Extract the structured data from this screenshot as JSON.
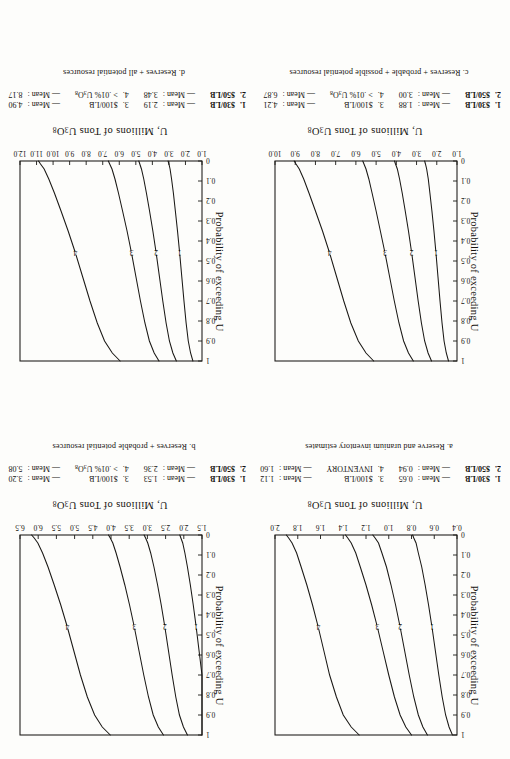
{
  "page": {
    "orientation_note": "upside-down-scan",
    "figure_count": 4
  },
  "common": {
    "ylabel": "Probability of exceeding U",
    "xlabel_prefix": "U, Millions of Tons U",
    "xlabel_sub1": "3",
    "xlabel_mid": "O",
    "xlabel_sub2": "8",
    "mean_word": "Mean :",
    "dash": "—",
    "curve_numbers": [
      "1",
      "2",
      "3",
      "4"
    ],
    "y_ticks": [
      "1",
      "0.9",
      "0.8",
      "0.7",
      "0.6",
      "0.5",
      "0.4",
      "0.3",
      "0.2",
      "0.1",
      "0"
    ],
    "y_values": [
      1,
      0.9,
      0.8,
      0.7,
      0.6,
      0.5,
      0.4,
      0.3,
      0.2,
      0.1,
      0
    ]
  },
  "figures": [
    {
      "id": "a",
      "caption": "a. Reserve and uranium inventory estimates",
      "x_ticks": [
        "0.4",
        "0.6",
        "0.8",
        "1.0",
        "1.2",
        "1.4",
        "1.6",
        "1.8",
        "2.0"
      ],
      "xlim": [
        0.4,
        2.0
      ],
      "legend": {
        "row1": {
          "key": "1.",
          "label": "$30/LB",
          "mean": "0.65",
          "key2": "3.",
          "label2": "$100/LB",
          "mean2": "1.12"
        },
        "row2": {
          "key": "2.",
          "label": "$50/LB",
          "mean": "0.94",
          "key2": "4.",
          "label2": "INVENTORY",
          "mean2": "1.60"
        }
      },
      "chart_data": {
        "type": "line",
        "title": "a. Reserve and uranium inventory estimates",
        "xlabel": "U, Millions of Tons U3O8",
        "ylabel": "Probability of exceeding U",
        "xlim": [
          0.4,
          2.0
        ],
        "ylim": [
          0,
          1
        ],
        "grid": false,
        "legend_position": "below-plot",
        "series": [
          {
            "name": "1. $30/LB",
            "mean": 0.65,
            "x": [
              0.44,
              0.47,
              0.5,
              0.53,
              0.56,
              0.59,
              0.62,
              0.65,
              0.68,
              0.71,
              0.74,
              0.76,
              0.78,
              0.79
            ],
            "y": [
              1.0,
              0.96,
              0.9,
              0.81,
              0.7,
              0.58,
              0.46,
              0.35,
              0.25,
              0.16,
              0.09,
              0.04,
              0.015,
              0.0
            ]
          },
          {
            "name": "2. $50/LB",
            "mean": 0.94,
            "x": [
              0.66,
              0.7,
              0.74,
              0.78,
              0.82,
              0.86,
              0.9,
              0.94,
              0.98,
              1.02,
              1.06,
              1.09,
              1.12,
              1.14
            ],
            "y": [
              1.0,
              0.96,
              0.9,
              0.81,
              0.7,
              0.58,
              0.46,
              0.35,
              0.25,
              0.16,
              0.09,
              0.04,
              0.015,
              0.0
            ]
          },
          {
            "name": "3. $100/LB",
            "mean": 1.12,
            "x": [
              0.8,
              0.85,
              0.9,
              0.95,
              1.0,
              1.05,
              1.1,
              1.15,
              1.2,
              1.25,
              1.29,
              1.33,
              1.36,
              1.38
            ],
            "y": [
              1.0,
              0.96,
              0.9,
              0.81,
              0.7,
              0.58,
              0.46,
              0.35,
              0.25,
              0.16,
              0.09,
              0.04,
              0.015,
              0.0
            ]
          },
          {
            "name": "4. INVENTORY",
            "mean": 1.6,
            "x": [
              1.26,
              1.33,
              1.4,
              1.46,
              1.52,
              1.57,
              1.62,
              1.67,
              1.72,
              1.77,
              1.81,
              1.85,
              1.88,
              1.9
            ],
            "y": [
              1.0,
              0.96,
              0.9,
              0.81,
              0.7,
              0.58,
              0.46,
              0.35,
              0.25,
              0.16,
              0.09,
              0.04,
              0.015,
              0.0
            ]
          }
        ]
      }
    },
    {
      "id": "b",
      "caption": "b. Reserves + probable potential resources",
      "x_ticks": [
        "1.5",
        "2.0",
        "2.5",
        "3.0",
        "3.5",
        "4.0",
        "4.5",
        "5.0",
        "5.5",
        "6.0",
        "6.5"
      ],
      "xlim": [
        1.5,
        6.5
      ],
      "legend": {
        "row1": {
          "key": "1.",
          "label": "$30/LB",
          "mean": "1.53",
          "key2": "3.",
          "label2": "$100/LB",
          "mean2": "3.20"
        },
        "row2": {
          "key": "2.",
          "label": "$50/LB",
          "mean": "2.36",
          "key2": "4.",
          "label2": "> .01% U3O8",
          "mean2": "5.08"
        }
      },
      "chart_data": {
        "type": "line",
        "title": "b. Reserves + probable potential resources",
        "xlabel": "U, Millions of Tons U3O8",
        "ylabel": "Probability of exceeding U",
        "xlim": [
          1.5,
          6.5
        ],
        "ylim": [
          0,
          1
        ],
        "grid": false,
        "legend_position": "below-plot",
        "series": [
          {
            "name": "1. $30/LB",
            "mean": 1.53,
            "x": [
              1.18,
              1.26,
              1.34,
              1.42,
              1.5,
              1.58,
              1.66,
              1.74,
              1.82,
              1.9,
              1.97,
              2.03,
              2.08,
              2.11
            ],
            "y": [
              1.0,
              0.96,
              0.9,
              0.81,
              0.7,
              0.58,
              0.46,
              0.35,
              0.25,
              0.16,
              0.09,
              0.04,
              0.015,
              0.0
            ]
          },
          {
            "name": "2. $50/LB",
            "mean": 2.36,
            "x": [
              1.9,
              2.01,
              2.12,
              2.22,
              2.32,
              2.42,
              2.52,
              2.62,
              2.72,
              2.82,
              2.91,
              2.99,
              3.05,
              3.09
            ],
            "y": [
              1.0,
              0.96,
              0.9,
              0.81,
              0.7,
              0.58,
              0.46,
              0.35,
              0.25,
              0.16,
              0.09,
              0.04,
              0.015,
              0.0
            ]
          },
          {
            "name": "3. $100/LB",
            "mean": 3.2,
            "x": [
              2.56,
              2.7,
              2.84,
              2.97,
              3.1,
              3.23,
              3.36,
              3.49,
              3.62,
              3.75,
              3.86,
              3.95,
              4.02,
              4.07
            ],
            "y": [
              1.0,
              0.96,
              0.9,
              0.81,
              0.7,
              0.58,
              0.46,
              0.35,
              0.25,
              0.16,
              0.09,
              0.04,
              0.015,
              0.0
            ]
          },
          {
            "name": "4. > .01% U3O8",
            "mean": 5.08,
            "x": [
              4.02,
              4.24,
              4.45,
              4.65,
              4.84,
              5.02,
              5.2,
              5.38,
              5.56,
              5.73,
              5.88,
              6.01,
              6.11,
              6.18
            ],
            "y": [
              1.0,
              0.96,
              0.9,
              0.81,
              0.7,
              0.58,
              0.46,
              0.35,
              0.25,
              0.16,
              0.09,
              0.04,
              0.015,
              0.0
            ]
          }
        ]
      }
    },
    {
      "id": "c",
      "caption": "c. Reserves + probable + possible potential resources",
      "x_ticks": [
        "1.0",
        "2.0",
        "3.0",
        "4.0",
        "5.0",
        "6.0",
        "7.0",
        "8.0",
        "9.0",
        "10.0"
      ],
      "xlim": [
        1.0,
        10.0
      ],
      "legend": {
        "row1": {
          "key": "1.",
          "label": "$30/LB",
          "mean": "1.88",
          "key2": "3.",
          "label2": "$100/LB",
          "mean2": "4.21"
        },
        "row2": {
          "key": "2.",
          "label": "$50/LB",
          "mean": "3.00",
          "key2": "4.",
          "label2": "> .01% U3O8",
          "mean2": "6.87"
        }
      },
      "chart_data": {
        "type": "line",
        "title": "c. Reserves + probable + possible potential resources",
        "xlabel": "U, Millions of Tons U3O8",
        "ylabel": "Probability of exceeding U",
        "xlim": [
          1.0,
          10.0
        ],
        "ylim": [
          0,
          1
        ],
        "grid": false,
        "legend_position": "below-plot",
        "series": [
          {
            "name": "1. $30/LB",
            "mean": 1.88,
            "x": [
              1.42,
              1.53,
              1.64,
              1.74,
              1.84,
              1.94,
              2.04,
              2.14,
              2.24,
              2.34,
              2.42,
              2.5,
              2.56,
              2.6
            ],
            "y": [
              1.0,
              0.96,
              0.9,
              0.81,
              0.7,
              0.58,
              0.46,
              0.35,
              0.25,
              0.16,
              0.09,
              0.04,
              0.015,
              0.0
            ]
          },
          {
            "name": "2. $50/LB",
            "mean": 3.0,
            "x": [
              2.26,
              2.43,
              2.6,
              2.76,
              2.92,
              3.08,
              3.24,
              3.4,
              3.56,
              3.71,
              3.84,
              3.95,
              4.04,
              4.09
            ],
            "y": [
              1.0,
              0.96,
              0.9,
              0.81,
              0.7,
              0.58,
              0.46,
              0.35,
              0.25,
              0.16,
              0.09,
              0.04,
              0.015,
              0.0
            ]
          },
          {
            "name": "3. $100/LB",
            "mean": 4.21,
            "x": [
              3.16,
              3.4,
              3.64,
              3.87,
              4.1,
              4.33,
              4.56,
              4.79,
              5.0,
              5.2,
              5.36,
              5.5,
              5.6,
              5.66
            ],
            "y": [
              1.0,
              0.96,
              0.9,
              0.81,
              0.7,
              0.58,
              0.46,
              0.35,
              0.25,
              0.16,
              0.09,
              0.04,
              0.015,
              0.0
            ]
          },
          {
            "name": "4. > .01% U3O8",
            "mean": 6.87,
            "x": [
              5.12,
              5.5,
              5.88,
              6.25,
              6.6,
              6.95,
              7.3,
              7.65,
              8.0,
              8.32,
              8.58,
              8.8,
              8.96,
              9.05
            ],
            "y": [
              1.0,
              0.96,
              0.9,
              0.81,
              0.7,
              0.58,
              0.46,
              0.35,
              0.25,
              0.16,
              0.09,
              0.04,
              0.015,
              0.0
            ]
          }
        ]
      }
    },
    {
      "id": "d",
      "caption": "d. Reserves + all potential resources",
      "x_ticks": [
        "1.0",
        "2.0",
        "3.0",
        "4.0",
        "5.0",
        "6.0",
        "7.0",
        "8.0",
        "9.0",
        "10.0",
        "11.0",
        "12.0"
      ],
      "xlim": [
        1.0,
        12.0
      ],
      "legend": {
        "row1": {
          "key": "1.",
          "label": "$30/LB",
          "mean": "2.19",
          "key2": "3.",
          "label2": "$100/LB",
          "mean2": "4.90"
        },
        "row2": {
          "key": "2.",
          "label": "$50/LB",
          "mean": "3.48",
          "key2": "4.",
          "label2": "> .01% U3O8",
          "mean2": "8.17"
        }
      },
      "chart_data": {
        "type": "line",
        "title": "d. Reserves + all potential resources",
        "xlabel": "U, Millions of Tons U3O8",
        "ylabel": "Probability of exceeding U",
        "xlim": [
          1.0,
          12.0
        ],
        "ylim": [
          0,
          1
        ],
        "grid": false,
        "legend_position": "below-plot",
        "series": [
          {
            "name": "1. $30/LB",
            "mean": 2.19,
            "x": [
              1.55,
              1.69,
              1.83,
              1.96,
              2.09,
              2.22,
              2.35,
              2.48,
              2.61,
              2.73,
              2.84,
              2.93,
              3.0,
              3.05
            ],
            "y": [
              1.0,
              0.96,
              0.9,
              0.81,
              0.7,
              0.58,
              0.46,
              0.35,
              0.25,
              0.16,
              0.09,
              0.04,
              0.015,
              0.0
            ]
          },
          {
            "name": "2. $50/LB",
            "mean": 3.48,
            "x": [
              2.55,
              2.76,
              2.97,
              3.17,
              3.37,
              3.57,
              3.77,
              3.97,
              4.17,
              4.36,
              4.52,
              4.66,
              4.76,
              4.82
            ],
            "y": [
              1.0,
              0.96,
              0.9,
              0.81,
              0.7,
              0.58,
              0.46,
              0.35,
              0.25,
              0.16,
              0.09,
              0.04,
              0.015,
              0.0
            ]
          },
          {
            "name": "3. $100/LB",
            "mean": 4.9,
            "x": [
              3.6,
              3.89,
              4.18,
              4.45,
              4.72,
              4.99,
              5.26,
              5.53,
              5.8,
              6.05,
              6.26,
              6.44,
              6.58,
              6.66
            ],
            "y": [
              1.0,
              0.96,
              0.9,
              0.81,
              0.7,
              0.58,
              0.46,
              0.35,
              0.25,
              0.16,
              0.09,
              0.04,
              0.015,
              0.0
            ]
          },
          {
            "name": "4. > .01% U3O8",
            "mean": 8.17,
            "x": [
              5.95,
              6.42,
              6.89,
              7.33,
              7.77,
              8.21,
              8.65,
              9.09,
              9.52,
              9.92,
              10.26,
              10.54,
              10.76,
              10.88
            ],
            "y": [
              1.0,
              0.96,
              0.9,
              0.81,
              0.7,
              0.58,
              0.46,
              0.35,
              0.25,
              0.16,
              0.09,
              0.04,
              0.015,
              0.0
            ]
          }
        ]
      }
    }
  ]
}
